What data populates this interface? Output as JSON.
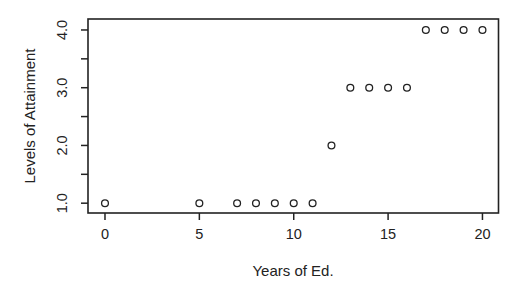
{
  "chart_data": {
    "type": "scatter",
    "title": "",
    "xlabel": "Years of Ed.",
    "ylabel": "Levels of Attainment",
    "points": [
      {
        "x": 0,
        "y": 1.0
      },
      {
        "x": 5,
        "y": 1.0
      },
      {
        "x": 7,
        "y": 1.0
      },
      {
        "x": 8,
        "y": 1.0
      },
      {
        "x": 9,
        "y": 1.0
      },
      {
        "x": 10,
        "y": 1.0
      },
      {
        "x": 11,
        "y": 1.0
      },
      {
        "x": 12,
        "y": 2.0
      },
      {
        "x": 13,
        "y": 3.0
      },
      {
        "x": 14,
        "y": 3.0
      },
      {
        "x": 15,
        "y": 3.0
      },
      {
        "x": 16,
        "y": 3.0
      },
      {
        "x": 17,
        "y": 4.0
      },
      {
        "x": 18,
        "y": 4.0
      },
      {
        "x": 19,
        "y": 4.0
      },
      {
        "x": 20,
        "y": 4.0
      }
    ],
    "x_ticks": [
      0,
      5,
      10,
      15,
      20
    ],
    "x_tick_labels": [
      "0",
      "5",
      "10",
      "15",
      "20"
    ],
    "y_ticks": [
      1.0,
      2.0,
      3.0,
      4.0
    ],
    "y_tick_labels": [
      "1.0",
      "2.0",
      "3.0",
      "4.0"
    ],
    "y_minor_ticks": [
      1.5,
      2.5,
      3.5
    ],
    "xlim": [
      -0.9,
      20.85
    ],
    "ylim": [
      0.83,
      4.19
    ],
    "grid": false,
    "legend": "none",
    "marker": "open-circle",
    "colors": {
      "stroke": "#222222",
      "marker_fill": "#ffffff",
      "background": "#ffffff"
    }
  }
}
